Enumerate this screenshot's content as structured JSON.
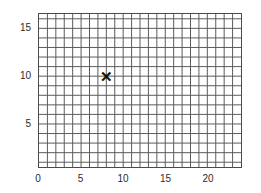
{
  "chart_data": {
    "type": "scatter",
    "title": "",
    "xlabel": "",
    "ylabel": "",
    "xlim": [
      0,
      24
    ],
    "ylim": [
      0.5,
      16.5
    ],
    "grid": true,
    "grid_step": 1,
    "legend": "none",
    "x_ticks": [
      {
        "value": 0,
        "label": "0"
      },
      {
        "value": 5,
        "label": "5"
      },
      {
        "value": 10,
        "label": "10"
      },
      {
        "value": 15,
        "label": "15"
      },
      {
        "value": 20,
        "label": "20"
      }
    ],
    "y_ticks": [
      {
        "value": 5,
        "label": "5"
      },
      {
        "value": 10,
        "label": "10"
      },
      {
        "value": 15,
        "label": "15"
      }
    ],
    "points": [
      {
        "x": 8,
        "y": 10,
        "marker": "x",
        "label": ""
      }
    ],
    "series": [
      {
        "name": "",
        "x": [
          8
        ],
        "y": [
          10
        ]
      }
    ]
  },
  "style": {
    "grid_line_color": "#5a5a5a",
    "grid_minor_color": "#6b6b6b",
    "axis_border_color": "#4a4a4a",
    "marker_color": "#111111",
    "tick_label_color": "#2b2b2b",
    "background_color": "#ffffff"
  },
  "marker_glyph": "✕"
}
